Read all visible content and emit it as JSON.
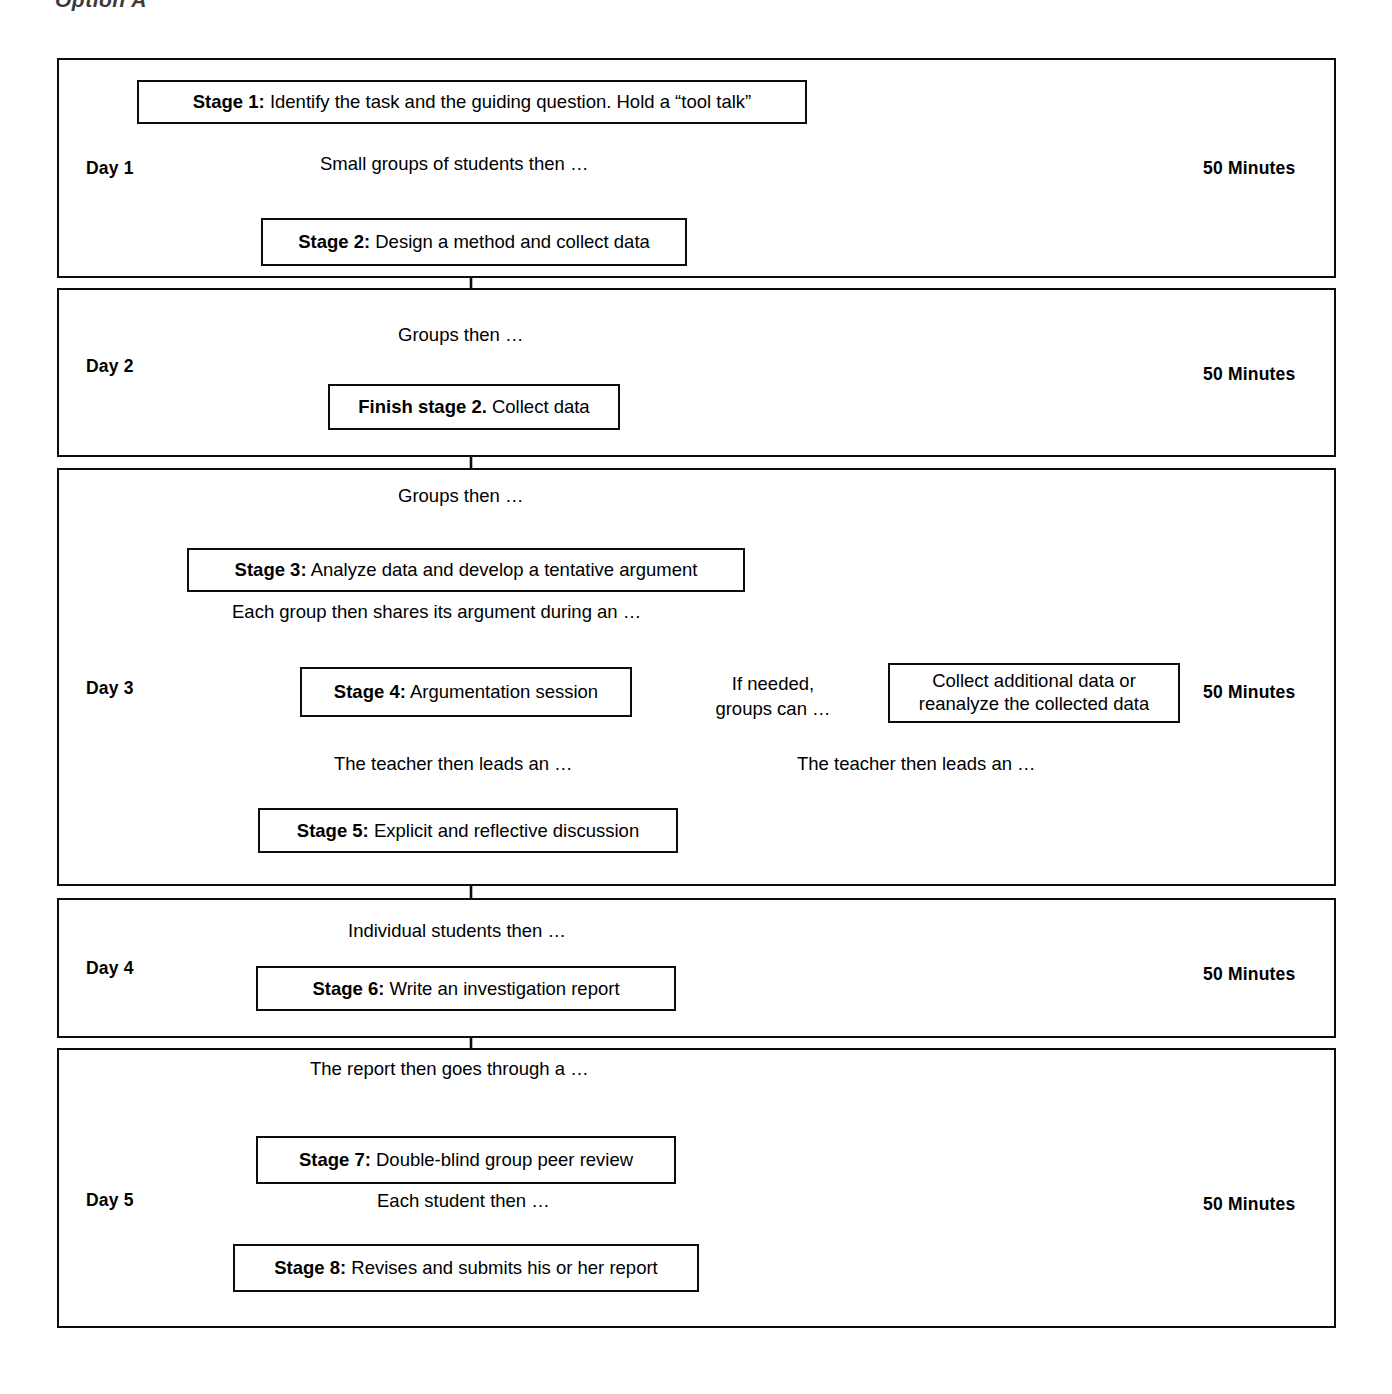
{
  "figure": {
    "caption_fragment": "Option A",
    "title_visible_partial": true
  },
  "layout": {
    "line_color": "#0d0d0d",
    "background": "#ffffff",
    "text_color": "#000000"
  },
  "days": [
    {
      "id": "day-1",
      "label": "Day 1",
      "duration": "50 Minutes",
      "stages": [
        {
          "id": "stage-1",
          "bold": "Stage 1:",
          "rest": " Identify the task and the guiding question. Hold a “tool talk”"
        },
        {
          "id": "stage-2",
          "bold": "Stage 2:",
          "rest": " Design a method and collect data"
        }
      ],
      "connectors": [
        {
          "id": "connector-day1-a",
          "text": "Small groups of students then …"
        }
      ]
    },
    {
      "id": "day-2",
      "label": "Day 2",
      "duration": "50 Minutes",
      "stages": [
        {
          "id": "finish-stage-2",
          "bold": "Finish stage 2.",
          "rest": " Collect data"
        }
      ],
      "connectors": [
        {
          "id": "connector-day2-a",
          "text": "Groups then …"
        }
      ]
    },
    {
      "id": "day-3",
      "label": "Day 3",
      "duration": "50 Minutes",
      "stages": [
        {
          "id": "stage-3",
          "bold": "Stage 3:",
          "rest": " Analyze data and develop a tentative argument"
        },
        {
          "id": "stage-4",
          "bold": "Stage 4:",
          "rest": " Argumentation session"
        },
        {
          "id": "stage-5",
          "bold": "Stage 5:",
          "rest": " Explicit and reflective discussion"
        },
        {
          "id": "collect-additional",
          "bold": "",
          "rest": "Collect additional data or reanalyze the collected data"
        }
      ],
      "connectors": [
        {
          "id": "connector-day3-a",
          "text": "Groups then …"
        },
        {
          "id": "connector-day3-b",
          "text": "Each group then shares its argument during an …"
        },
        {
          "id": "connector-day3-c",
          "text": "The teacher then leads an …"
        },
        {
          "id": "connector-day3-branch",
          "text": "If needed,\ngroups can …"
        },
        {
          "id": "connector-day3-return",
          "text": "The teacher then leads an …"
        }
      ]
    },
    {
      "id": "day-4",
      "label": "Day 4",
      "duration": "50 Minutes",
      "stages": [
        {
          "id": "stage-6",
          "bold": "Stage 6:",
          "rest": " Write an investigation report"
        }
      ],
      "connectors": [
        {
          "id": "connector-day4-a",
          "text": "Individual students then …"
        }
      ]
    },
    {
      "id": "day-5",
      "label": "Day 5",
      "duration": "50 Minutes",
      "stages": [
        {
          "id": "stage-7",
          "bold": "Stage 7:",
          "rest": " Double-blind group peer review"
        },
        {
          "id": "stage-8",
          "bold": "Stage 8:",
          "rest": " Revises and submits his or her report"
        }
      ],
      "connectors": [
        {
          "id": "connector-day5-a",
          "text": "The report then goes through a …"
        },
        {
          "id": "connector-day5-b",
          "text": "Each student then …"
        }
      ]
    }
  ],
  "branch_label_line1": "If needed,",
  "branch_label_line2": "groups can …",
  "collect_box_line1": "Collect additional data or",
  "collect_box_line2": "reanalyze the collected data"
}
